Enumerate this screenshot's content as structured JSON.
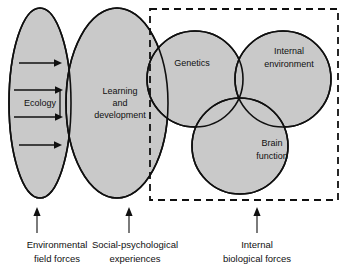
{
  "figure": {
    "background_color": "#ffffff",
    "shape_fill_color": "#c9c9c9",
    "line_color": "#101010"
  },
  "shapes": {
    "ecology": {
      "label": "Ecology",
      "type": "ellipse"
    },
    "learning": {
      "label_line1": "Learning",
      "label_line2": "and",
      "label_line3": "development",
      "type": "ellipse"
    },
    "genetics": {
      "label": "Genetics",
      "type": "circle"
    },
    "internal_environment": {
      "label_line1": "Internal",
      "label_line2": "environment",
      "type": "circle"
    },
    "brain_function": {
      "label_line1": "Brain",
      "label_line2": "function",
      "type": "circle"
    }
  },
  "dashed_region": {
    "name": "internal-biological-forces-region",
    "style": "dashed rectangle"
  },
  "flow_arrows": {
    "count": 4,
    "direction": "left-to-right",
    "description": "arrows from Ecology into Learning and development"
  },
  "captions": [
    {
      "id": "environmental-field-forces",
      "line1": "Environmental",
      "line2": "field forces"
    },
    {
      "id": "social-psychological-experiences",
      "line1": "Social-psychological",
      "line2": "experiences"
    },
    {
      "id": "internal-biological-forces",
      "line1": "Internal",
      "line2": "biological forces"
    }
  ]
}
